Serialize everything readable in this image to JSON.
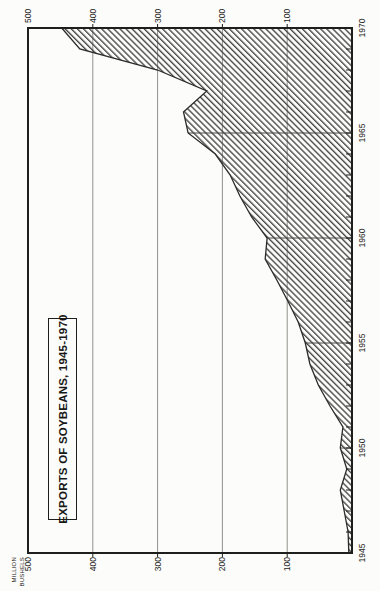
{
  "window": {
    "width": 380,
    "height": 591,
    "description": "scanned statistical chart page, rotated 90 degrees counterclockwise"
  },
  "title_box": {
    "label": "EXPORTS OF SOYBEANS, 1945-1970"
  },
  "y_axis": {
    "caption": [
      "MILLION",
      "BUSHELS"
    ],
    "left_labels": [
      "500",
      "400",
      "300",
      "200",
      "100"
    ],
    "right_labels": [
      "500",
      "400",
      "300",
      "200",
      "100"
    ]
  },
  "x_axis": {
    "labels": [
      "1945",
      "1950",
      "1955",
      "1960",
      "1965",
      "1970"
    ]
  },
  "chart_data": {
    "type": "area",
    "title": "EXPORTS OF SOYBEANS, 1945-1970",
    "ylabel": "MILLION BUSHELS",
    "xlabel": "",
    "x": [
      1945,
      1946,
      1947,
      1948,
      1949,
      1950,
      1951,
      1952,
      1953,
      1954,
      1955,
      1956,
      1957,
      1958,
      1959,
      1960,
      1961,
      1962,
      1963,
      1964,
      1965,
      1966,
      1967,
      1968,
      1969,
      1970
    ],
    "values": [
      5,
      6,
      12,
      18,
      8,
      18,
      14,
      34,
      52,
      65,
      72,
      83,
      99,
      116,
      134,
      131,
      155,
      173,
      188,
      211,
      253,
      260,
      224,
      300,
      420,
      448
    ],
    "xlim": [
      1945,
      1970
    ],
    "ylim": [
      0,
      500
    ],
    "y_gridlines": [
      100,
      200,
      300,
      400
    ],
    "x_gridlines": [
      1950,
      1955,
      1960,
      1965
    ],
    "x_gridlines_clipped_to_area": true,
    "yearly_tick_marks": true,
    "fill_style": "diagonal-hatch",
    "legend": "none",
    "rendered_rotation_deg": -90
  },
  "colors": {
    "paper": "#fcfcfa",
    "frame": "#1e1e1c",
    "value_grid": "#90908c",
    "year_grid": "#484846",
    "curve": "#2b2b29",
    "hatch": "#454543",
    "text": "#232321"
  },
  "geometry": {
    "plot_left": 38,
    "plot_top": 28,
    "plot_right": 563,
    "plot_bottom": 352
  }
}
